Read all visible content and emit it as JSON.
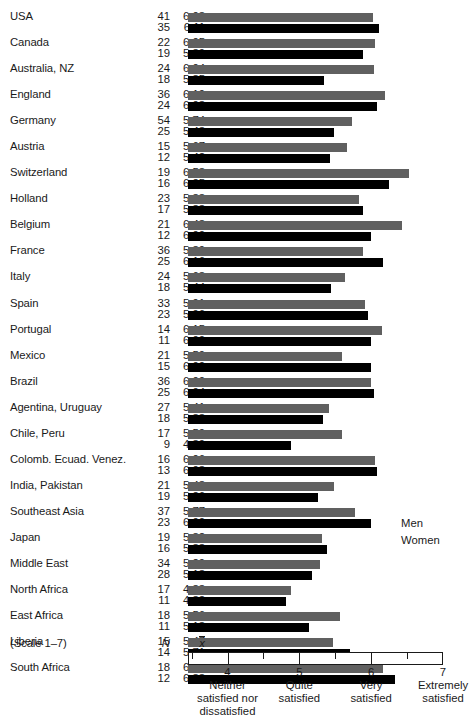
{
  "chart_data": {
    "type": "bar",
    "orientation": "horizontal",
    "title": "",
    "xlabel": "",
    "ylabel": "",
    "xlim": [
      3.45,
      7.0
    ],
    "grid": false,
    "scale_note": "(Scale 1–7)",
    "column_headers": {
      "n": "N",
      "mean": "x̄"
    },
    "legend": {
      "position": "right",
      "entries": [
        {
          "name": "Men",
          "color": "#606060"
        },
        {
          "name": "Women",
          "color": "#000000"
        }
      ]
    },
    "axis": {
      "ticks": [
        4,
        5,
        6,
        7
      ],
      "tick_labels": [
        "4",
        "5",
        "6",
        "7"
      ],
      "minor_ticks": [
        3.5,
        4.5,
        5.5,
        6.5
      ],
      "tick_captions": [
        "Neither satisfied nor dissatisfied",
        "Quite satisfied",
        "Very satisfied",
        "Extremely satisfied"
      ],
      "tick_caption_lines": [
        [
          "Neither",
          "satisfied nor",
          "dissatisfied"
        ],
        [
          "Quite",
          "satisfied"
        ],
        [
          "Very",
          "satisfied"
        ],
        [
          "Extremely",
          "satisfied"
        ]
      ]
    },
    "categories": [
      "USA",
      "Canada",
      "Australia, NZ",
      "England",
      "Germany",
      "Austria",
      "Switzerland",
      "Holland",
      "Belgium",
      "France",
      "Italy",
      "Spain",
      "Portugal",
      "Mexico",
      "Brazil",
      "Agentina, Uruguay",
      "Chile, Peru",
      "Colomb. Ecuad. Venez.",
      "India, Pakistan",
      "Southeast Asia",
      "Japan",
      "Middle East",
      "North Africa",
      "East Africa",
      "Liberia",
      "South Africa"
    ],
    "series": [
      {
        "name": "Men",
        "color": "#606060",
        "values": [
          6.03,
          6.05,
          6.04,
          6.19,
          5.74,
          5.67,
          6.53,
          5.83,
          6.43,
          5.89,
          5.63,
          5.91,
          6.15,
          5.59,
          6.0,
          5.41,
          5.59,
          6.06,
          5.48,
          5.77,
          5.32,
          5.29,
          4.88,
          5.56,
          5.47,
          6.16
        ],
        "n": [
          41,
          22,
          24,
          36,
          54,
          15,
          19,
          23,
          21,
          36,
          24,
          33,
          14,
          21,
          36,
          27,
          17,
          16,
          21,
          37,
          19,
          34,
          17,
          18,
          15,
          18
        ]
      },
      {
        "name": "Women",
        "color": "#000000",
        "values": [
          6.11,
          5.89,
          5.35,
          6.08,
          5.48,
          5.42,
          6.25,
          5.88,
          6.0,
          6.16,
          5.44,
          5.96,
          6.0,
          6.0,
          6.04,
          5.33,
          4.89,
          6.08,
          5.26,
          6.0,
          5.38,
          5.18,
          4.82,
          5.13,
          5.71,
          6.33
        ],
        "n": [
          35,
          19,
          18,
          24,
          25,
          12,
          16,
          17,
          12,
          25,
          18,
          23,
          11,
          15,
          25,
          18,
          9,
          13,
          19,
          23,
          16,
          28,
          11,
          11,
          14,
          12
        ]
      }
    ],
    "rows": [
      {
        "label": "USA",
        "men_n": 41,
        "men_mean": "6.03",
        "women_n": 35,
        "women_mean": "6.11"
      },
      {
        "label": "Canada",
        "men_n": 22,
        "men_mean": "6.05",
        "women_n": 19,
        "women_mean": "5.89"
      },
      {
        "label": "Australia, NZ",
        "men_n": 24,
        "men_mean": "6.04",
        "women_n": 18,
        "women_mean": "5.35"
      },
      {
        "label": "England",
        "men_n": 36,
        "men_mean": "6.19",
        "women_n": 24,
        "women_mean": "6.08"
      },
      {
        "label": "Germany",
        "men_n": 54,
        "men_mean": "5.74",
        "women_n": 25,
        "women_mean": "5.48"
      },
      {
        "label": "Austria",
        "men_n": 15,
        "men_mean": "5.67",
        "women_n": 12,
        "women_mean": "5.42"
      },
      {
        "label": "Switzerland",
        "men_n": 19,
        "men_mean": "6.53",
        "women_n": 16,
        "women_mean": "6.25"
      },
      {
        "label": "Holland",
        "men_n": 23,
        "men_mean": "5.83",
        "women_n": 17,
        "women_mean": "5.88"
      },
      {
        "label": "Belgium",
        "men_n": 21,
        "men_mean": "6.43",
        "women_n": 12,
        "women_mean": "6.00"
      },
      {
        "label": "France",
        "men_n": 36,
        "men_mean": "5.89",
        "women_n": 25,
        "women_mean": "6.16"
      },
      {
        "label": "Italy",
        "men_n": 24,
        "men_mean": "5.63",
        "women_n": 18,
        "women_mean": "5.44"
      },
      {
        "label": "Spain",
        "men_n": 33,
        "men_mean": "5.91",
        "women_n": 23,
        "women_mean": "5.96"
      },
      {
        "label": "Portugal",
        "men_n": 14,
        "men_mean": "6.15",
        "women_n": 11,
        "women_mean": "6.00"
      },
      {
        "label": "Mexico",
        "men_n": 21,
        "men_mean": "5.59",
        "women_n": 15,
        "women_mean": "6.00"
      },
      {
        "label": "Brazil",
        "men_n": 36,
        "men_mean": "6.00",
        "women_n": 25,
        "women_mean": "6.04"
      },
      {
        "label": "Agentina, Uruguay",
        "men_n": 27,
        "men_mean": "5.41",
        "women_n": 18,
        "women_mean": "5.33"
      },
      {
        "label": "Chile, Peru",
        "men_n": 17,
        "men_mean": "5.59",
        "women_n": 9,
        "women_mean": "4.89"
      },
      {
        "label": "Colomb. Ecuad. Venez.",
        "men_n": 16,
        "men_mean": "6.06",
        "women_n": 13,
        "women_mean": "6.08"
      },
      {
        "label": "India, Pakistan",
        "men_n": 21,
        "men_mean": "5.48",
        "women_n": 19,
        "women_mean": "5.26"
      },
      {
        "label": "Southeast Asia",
        "men_n": 37,
        "men_mean": "5.77",
        "women_n": 23,
        "women_mean": "6.00"
      },
      {
        "label": "Japan",
        "men_n": 19,
        "men_mean": "5.32",
        "women_n": 16,
        "women_mean": "5.38"
      },
      {
        "label": "Middle East",
        "men_n": 34,
        "men_mean": "5.29",
        "women_n": 28,
        "women_mean": "5.18"
      },
      {
        "label": "North Africa",
        "men_n": 17,
        "men_mean": "4.88",
        "women_n": 11,
        "women_mean": "4.82"
      },
      {
        "label": "East Africa",
        "men_n": 18,
        "men_mean": "5.56",
        "women_n": 11,
        "women_mean": "5.13"
      },
      {
        "label": "Liberia",
        "men_n": 15,
        "men_mean": "5.47",
        "women_n": 14,
        "women_mean": "5.71"
      },
      {
        "label": "South Africa",
        "men_n": 18,
        "men_mean": "6.16",
        "women_n": 12,
        "women_mean": "6.33"
      }
    ]
  }
}
